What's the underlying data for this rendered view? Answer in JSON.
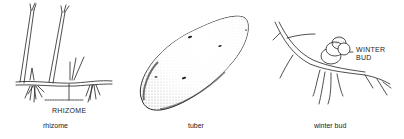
{
  "figure": {
    "panels": [
      {
        "id": "rhizome",
        "caption": "rhizome",
        "callout": "RHIZOME"
      },
      {
        "id": "tuber",
        "caption": "tuber"
      },
      {
        "id": "winter-bud",
        "caption": "winter bud",
        "callout_line1": "WINTER",
        "callout_line2": "BUD"
      }
    ]
  }
}
